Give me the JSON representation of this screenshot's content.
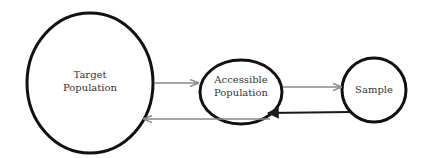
{
  "diagram": {
    "nodes": [
      {
        "id": "target",
        "label_lines": [
          "Target",
          "Population"
        ]
      },
      {
        "id": "accessible",
        "label_lines": [
          "Accessible",
          "Population"
        ]
      },
      {
        "id": "sample",
        "label_lines": [
          "Sample"
        ]
      }
    ],
    "edges": [
      {
        "from": "target",
        "to": "accessible",
        "color": "#8a8a8a"
      },
      {
        "from": "accessible",
        "to": "sample",
        "color": "#8a8a8a"
      },
      {
        "from": "sample",
        "to": "accessible",
        "color": "#1a1a1a"
      },
      {
        "from": "accessible",
        "to": "target",
        "color": "#8a8a8a"
      }
    ],
    "node_stroke_color": "#111111"
  }
}
